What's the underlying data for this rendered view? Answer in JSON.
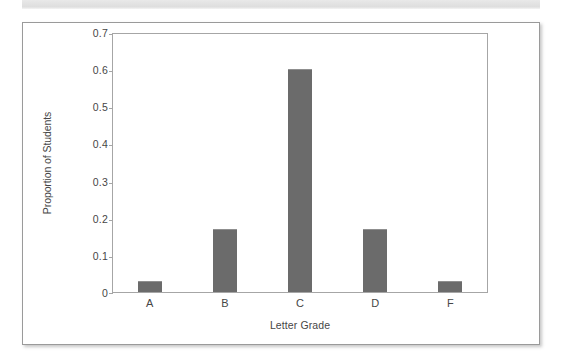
{
  "figure": {
    "background_color": "#ffffff",
    "border_color": "#9a9a9a",
    "scan_band_color": "#e2e2e2"
  },
  "chart_data": {
    "type": "bar",
    "title": "",
    "subtitle": "",
    "categories": [
      "A",
      "B",
      "C",
      "D",
      "F"
    ],
    "values": [
      0.03,
      0.17,
      0.6,
      0.17,
      0.03
    ],
    "series": [
      {
        "name": "Proportion of Students",
        "values": [
          0.03,
          0.17,
          0.6,
          0.17,
          0.03
        ]
      }
    ],
    "xlabel": "Letter Grade",
    "ylabel": "Proportion of Students",
    "ylim": [
      0,
      0.7
    ],
    "yticks": [
      0,
      0.1,
      0.2,
      0.3,
      0.4,
      0.5,
      0.6,
      0.7
    ],
    "ytick_labels": [
      "0",
      "0.1",
      "0.2",
      "0.3",
      "0.4",
      "0.5",
      "0.6",
      "0.7"
    ],
    "grid": false,
    "legend": false,
    "legend_position": "none",
    "bar_color": "#6b6b6b",
    "axis_color": "#a6a6a6",
    "text_color": "#464646"
  }
}
